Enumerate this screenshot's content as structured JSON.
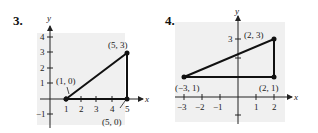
{
  "problems": [
    {
      "number": "3.",
      "axis_labels": {
        "x": "x",
        "y": "y"
      },
      "x_ticks": [
        "1",
        "2",
        "3",
        "4",
        "5"
      ],
      "y_ticks": [
        "4",
        "3",
        "2",
        "1",
        "-1"
      ],
      "points": [
        {
          "label": "(1, 0)",
          "x": 1,
          "y": 0
        },
        {
          "label": "(5, 3)",
          "x": 5,
          "y": 3
        },
        {
          "label": "(5, 0)",
          "x": 5,
          "y": 0
        }
      ]
    },
    {
      "number": "4.",
      "axis_labels": {
        "x": "x",
        "y": "y"
      },
      "x_ticks": [
        "-3",
        "-2",
        "-1",
        "1",
        "2"
      ],
      "y_ticks": [
        "3"
      ],
      "points": [
        {
          "label": "(-3, 1)",
          "x": -3,
          "y": 1
        },
        {
          "label": "(2, 3)",
          "x": 2,
          "y": 3
        },
        {
          "label": "(2, 1)",
          "x": 2,
          "y": 1
        }
      ]
    }
  ],
  "colors": {
    "panel_bg": "#f0f0f0",
    "ink": "#111111"
  }
}
